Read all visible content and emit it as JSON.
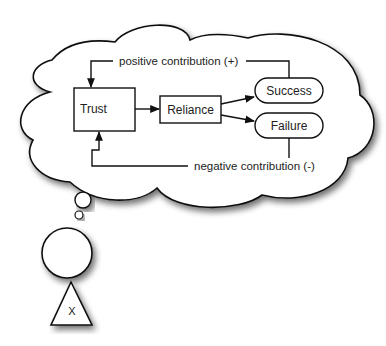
{
  "diagram": {
    "nodes": {
      "trust": {
        "label": "Trust"
      },
      "reliance": {
        "label": "Reliance"
      },
      "success": {
        "label": "Success"
      },
      "failure": {
        "label": "Failure"
      }
    },
    "edges": {
      "positive": {
        "label": "positive contribution (+)"
      },
      "negative": {
        "label": "negative contribution (-)"
      }
    },
    "agent": {
      "label": "X"
    }
  }
}
